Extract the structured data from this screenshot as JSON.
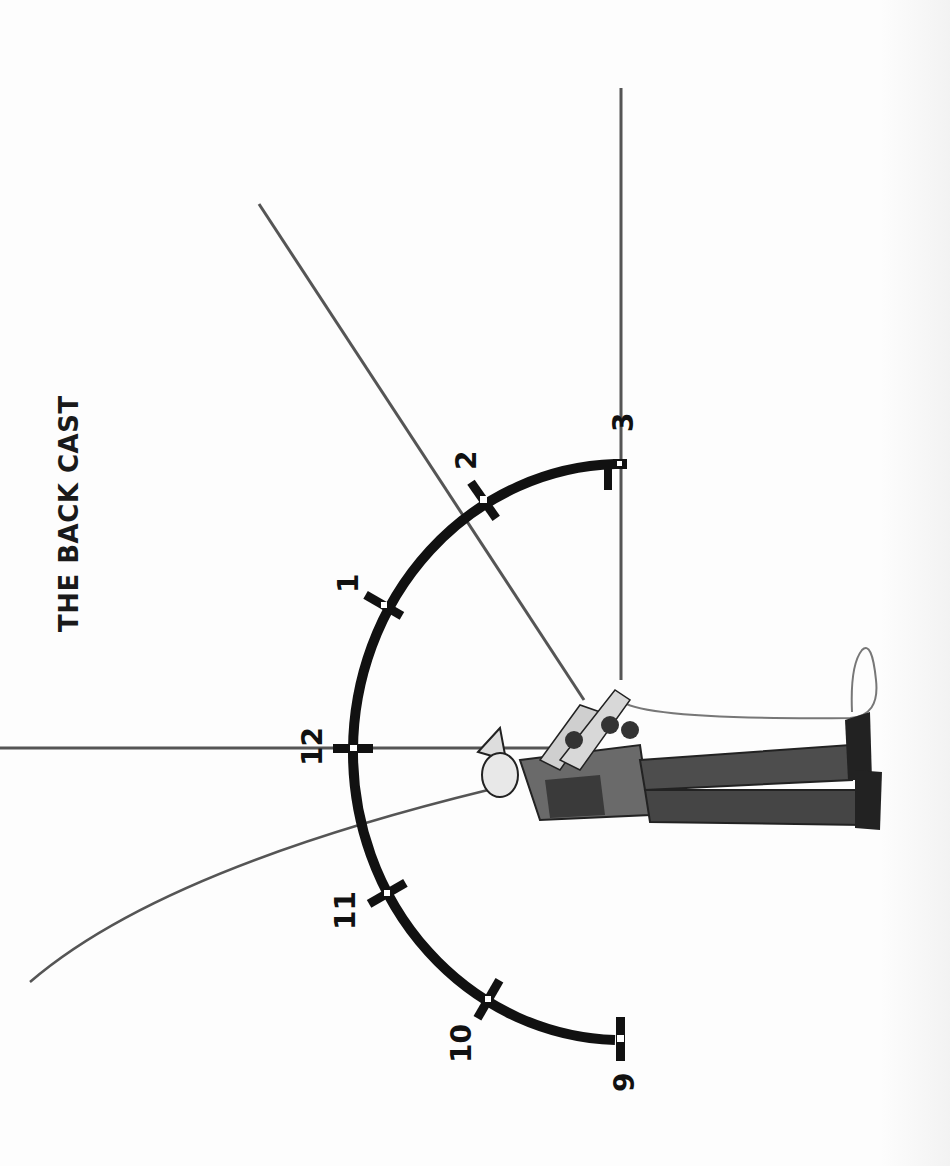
{
  "title": "THE BACK CAST",
  "clock": {
    "positions": [
      {
        "label": "9",
        "angle_deg": 90
      },
      {
        "label": "10",
        "angle_deg": 60
      },
      {
        "label": "11",
        "angle_deg": 30
      },
      {
        "label": "12",
        "angle_deg": 0
      },
      {
        "label": "1",
        "angle_deg": -30
      },
      {
        "label": "2",
        "angle_deg": -60
      },
      {
        "label": "3",
        "angle_deg": -90
      }
    ]
  },
  "rods": [
    {
      "name": "rod-at-3",
      "description": "rod at 3 o'clock position"
    },
    {
      "name": "rod-at-2",
      "description": "rod at 2 o'clock position"
    },
    {
      "name": "rod-at-12",
      "description": "rod at 12 o'clock position"
    },
    {
      "name": "rod-flexed-back",
      "description": "flexed rod loading behind"
    }
  ],
  "colors": {
    "ink": "#111111",
    "rod": "#555555",
    "background": "#fdfdfd"
  }
}
